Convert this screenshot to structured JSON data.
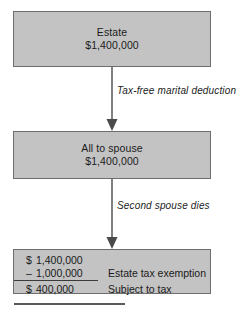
{
  "diagram": {
    "colors": {
      "box_fill": "#c3c3c3",
      "box_border": "#6e6e6e",
      "arrow": "#4a4a4a",
      "text": "#1b1b1b",
      "rule": "#5a5a5a"
    },
    "nodes": [
      {
        "id": "estate",
        "line1": "Estate",
        "line2": "$1,400,000"
      },
      {
        "id": "all-to-spouse",
        "line1": "All to spouse",
        "line2": "$1,400,000"
      }
    ],
    "edges": [
      {
        "id": "marital-deduction",
        "label": "Tax-free marital deduction",
        "from": "estate",
        "to": "all-to-spouse"
      },
      {
        "id": "second-death",
        "label": "Second spouse dies",
        "from": "all-to-spouse",
        "to": "calculation"
      }
    ],
    "calculation": {
      "rows": [
        {
          "sign": "$",
          "amount": "1,400,000",
          "description": ""
        },
        {
          "sign": "–",
          "amount": "1,000,000",
          "description": "Estate tax exemption"
        },
        {
          "sign": "$",
          "amount": "400,000",
          "description": "Subject to tax"
        }
      ]
    }
  }
}
